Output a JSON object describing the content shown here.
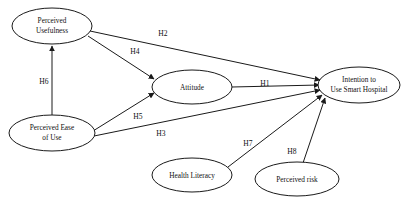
{
  "diagram": {
    "type": "path-model-diagram",
    "background_color": "#ffffff",
    "line_color": "#1a1a1a",
    "text_color": "#111111",
    "nodes": [
      {
        "id": "perceived_usefulness",
        "label_line1": "Perceived",
        "label_line2": "Usefulness",
        "cx": 52,
        "cy": 26,
        "rx": 40,
        "ry": 18
      },
      {
        "id": "perceived_ease_of_use",
        "label_line1": "Perceived Ease",
        "label_line2": "of Use",
        "cx": 52,
        "cy": 133,
        "rx": 43,
        "ry": 18
      },
      {
        "id": "attitude",
        "label_line1": "Attitude",
        "label_line2": "",
        "cx": 192,
        "cy": 87,
        "rx": 40,
        "ry": 17
      },
      {
        "id": "intention_to_use_smart_hospital",
        "label_line1": "Intention to",
        "label_line2": "Use Smart Hospital",
        "cx": 359,
        "cy": 85,
        "rx": 41,
        "ry": 18
      },
      {
        "id": "health_literacy",
        "label_line1": "Health Literacy",
        "label_line2": "",
        "cx": 192,
        "cy": 175,
        "rx": 40,
        "ry": 17
      },
      {
        "id": "perceived_risk",
        "label_line1": "Perceived risk",
        "label_line2": "",
        "cx": 297,
        "cy": 179,
        "rx": 42,
        "ry": 17
      }
    ],
    "edges": [
      {
        "id": "h2",
        "label": "H2",
        "from": "perceived_usefulness",
        "to": "intention_to_use_smart_hospital",
        "label_x": 163,
        "label_y": 34
      },
      {
        "id": "h4",
        "label": "H4",
        "from": "perceived_usefulness",
        "to": "attitude",
        "label_x": 135,
        "label_y": 52
      },
      {
        "id": "h6",
        "label": "H6",
        "from": "perceived_ease_of_use",
        "to": "perceived_usefulness",
        "label_x": 44,
        "label_y": 82
      },
      {
        "id": "h5",
        "label": "H5",
        "from": "perceived_ease_of_use",
        "to": "attitude",
        "label_x": 138,
        "label_y": 117
      },
      {
        "id": "h3",
        "label": "H3",
        "from": "perceived_ease_of_use",
        "to": "intention_to_use_smart_hospital",
        "label_x": 161,
        "label_y": 134
      },
      {
        "id": "h1",
        "label": "H1",
        "from": "attitude",
        "to": "intention_to_use_smart_hospital",
        "label_x": 265,
        "label_y": 84
      },
      {
        "id": "h7",
        "label": "H7",
        "from": "health_literacy",
        "to": "intention_to_use_smart_hospital",
        "label_x": 248,
        "label_y": 144
      },
      {
        "id": "h8",
        "label": "H8",
        "from": "perceived_risk",
        "to": "intention_to_use_smart_hospital",
        "label_x": 292,
        "label_y": 152
      }
    ]
  }
}
